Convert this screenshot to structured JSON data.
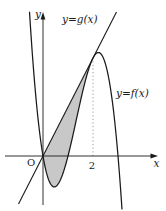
{
  "figure": {
    "labels": {
      "g_curve": "y=g(x)",
      "f_curve": "y=f(x)",
      "origin": "O",
      "x_tick": "2",
      "x_axis": "x",
      "y_axis": "y"
    },
    "colors": {
      "curve": "#1a1a1a",
      "axis": "#1a1a1a",
      "shade": "#c8c8c8",
      "dashed": "#9a9a9a",
      "background": "#ffffff"
    }
  },
  "chart_data": {
    "type": "line",
    "title": "",
    "xlabel": "x",
    "ylabel": "y",
    "origin_label": "O",
    "x_tick_labels": [
      "2"
    ],
    "series": [
      {
        "name": "f",
        "label": "y=f(x)",
        "kind": "cubic",
        "description": "Downward cubic through the origin; x-intercepts at approximately x=0, x=1 and x=3; dips below the x-axis on (0,1), local maximum near x=2.2, falls steeply after x=3; left branch rises steeply for x<0.",
        "roots": [
          0,
          1,
          3
        ],
        "leading_sign": -1
      },
      {
        "name": "g",
        "label": "y=g(x)",
        "kind": "linear",
        "description": "Straight line through the origin with positive slope, tangent to y=f(x) at x=2.",
        "passes_through_origin": true,
        "tangent_to_f_at_x": 2
      }
    ],
    "shaded_region": {
      "between": [
        "g",
        "f"
      ],
      "interval": [
        0,
        2
      ],
      "fill": "#c8c8c8"
    },
    "dashed_guide": {
      "x": 2,
      "from_y": 0,
      "to": "tangent point (2, g(2))"
    },
    "legend_position": "labels next to curves",
    "grid": false
  }
}
